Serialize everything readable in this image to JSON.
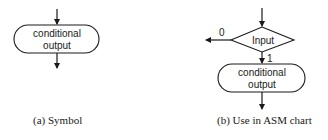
{
  "panel_a": {
    "box_line1": "conditional",
    "box_line2": "output",
    "caption": "(a) Symbol"
  },
  "panel_b": {
    "decision_label": "Input",
    "false_label": "0",
    "true_label": "1",
    "box_line1": "conditional",
    "box_line2": "output",
    "caption": "(b) Use in ASM chart"
  },
  "colors": {
    "stroke": "#1a1a1a",
    "background": "#ffffff"
  }
}
